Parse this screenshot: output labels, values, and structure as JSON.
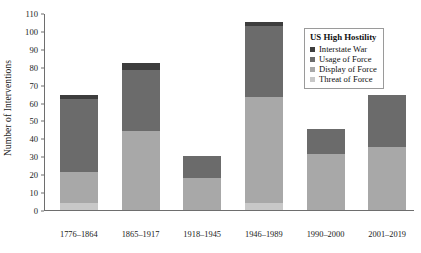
{
  "chart_data": {
    "type": "bar",
    "subtype": "stacked-bar",
    "title": "",
    "xlabel": "",
    "ylabel": "Number of Interventions",
    "ylim": [
      0,
      110
    ],
    "ytick_step": 10,
    "yticks": [
      0,
      10,
      20,
      30,
      40,
      50,
      60,
      70,
      80,
      90,
      100,
      110
    ],
    "grid": false,
    "legend_position": "top-right-inside",
    "legend_title": "US High Hostility",
    "categories": [
      "1776–1864",
      "1865–1917",
      "1918–1945",
      "1946–1989",
      "1990–2000",
      "2001–2019"
    ],
    "series": [
      {
        "name": "Threat of Force",
        "color": "#c8c8c8",
        "values": [
          4,
          0,
          0,
          4,
          0,
          0
        ]
      },
      {
        "name": "Display of Force",
        "color": "#a8a8a8",
        "values": [
          17,
          44,
          18,
          59,
          31,
          35
        ]
      },
      {
        "name": "Usage of Force",
        "color": "#6b6b6b",
        "values": [
          41,
          34,
          12,
          40,
          14,
          29
        ]
      },
      {
        "name": "Interstate War",
        "color": "#3d3d3d",
        "values": [
          2,
          4,
          0,
          2,
          0,
          0
        ]
      }
    ],
    "stack_order_bottom_to_top": [
      "Threat of Force",
      "Display of Force",
      "Usage of Force",
      "Interstate War"
    ],
    "totals": [
      64,
      82,
      30,
      105,
      45,
      64
    ]
  },
  "legend": {
    "title": "US High Hostility",
    "entries": [
      {
        "label": "Interstate War",
        "color": "#3d3d3d"
      },
      {
        "label": "Usage of Force",
        "color": "#6b6b6b"
      },
      {
        "label": "Display of Force",
        "color": "#a8a8a8"
      },
      {
        "label": "Threat of Force",
        "color": "#c8c8c8"
      }
    ]
  },
  "axes": {
    "y_title": "Number of Interventions"
  }
}
